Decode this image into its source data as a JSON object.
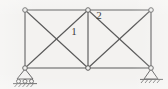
{
  "figure": {
    "kind": "truss-structural-diagram",
    "background_color": "#f3f2f0",
    "line_color": "#5a5a5a",
    "joint_fill_color": "#efefed",
    "text_color": "#3b3b3b",
    "labels": [
      {
        "text": "1",
        "x": 74,
        "y": 35,
        "name": "member-label-1"
      },
      {
        "text": "2",
        "x": 99,
        "y": 19,
        "name": "member-label-2"
      }
    ],
    "joints": [
      {
        "id": "A",
        "x": 25,
        "y": 10,
        "name": "joint-top-left"
      },
      {
        "id": "B",
        "x": 88,
        "y": 10,
        "name": "joint-top-middle"
      },
      {
        "id": "C",
        "x": 151,
        "y": 10,
        "name": "joint-top-right"
      },
      {
        "id": "D",
        "x": 25,
        "y": 68,
        "name": "joint-bottom-left"
      },
      {
        "id": "E",
        "x": 88,
        "y": 68,
        "name": "joint-bottom-middle"
      },
      {
        "id": "F",
        "x": 151,
        "y": 68,
        "name": "joint-bottom-right"
      }
    ],
    "members": [
      {
        "from": "A",
        "to": "B",
        "type": "top-chord",
        "name": "member-top-left"
      },
      {
        "from": "B",
        "to": "C",
        "type": "top-chord",
        "name": "member-top-right"
      },
      {
        "from": "D",
        "to": "E",
        "type": "bottom-chord",
        "name": "member-bottom-left"
      },
      {
        "from": "E",
        "to": "F",
        "type": "bottom-chord",
        "name": "member-bottom-right"
      },
      {
        "from": "A",
        "to": "D",
        "type": "vertical",
        "name": "member-vertical-left"
      },
      {
        "from": "B",
        "to": "E",
        "type": "vertical",
        "name": "member-vertical-middle"
      },
      {
        "from": "C",
        "to": "F",
        "type": "vertical",
        "name": "member-vertical-right"
      },
      {
        "from": "A",
        "to": "E",
        "type": "diagonal",
        "name": "member-diagonal-left-down"
      },
      {
        "from": "D",
        "to": "B",
        "type": "diagonal",
        "name": "member-diagonal-left-up"
      },
      {
        "from": "B",
        "to": "F",
        "type": "diagonal",
        "name": "member-diagonal-right-down"
      },
      {
        "from": "E",
        "to": "C",
        "type": "diagonal",
        "name": "member-diagonal-right-up"
      }
    ],
    "supports": [
      {
        "at": "D",
        "type": "roller",
        "name": "support-roller-left",
        "x": 25,
        "y": 68,
        "description": "roller support with triangle, rollers and hatched ground"
      },
      {
        "at": "F",
        "type": "pin",
        "name": "support-pin-right",
        "x": 151,
        "y": 68,
        "description": "pinned support on hatched ground line"
      }
    ]
  }
}
